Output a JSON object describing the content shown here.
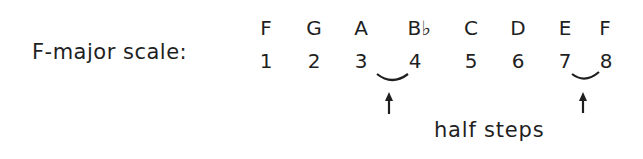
{
  "label": "F-major scale:",
  "notes": [
    "F",
    "G",
    "A",
    "B♭",
    "C",
    "D",
    "E",
    "F"
  ],
  "degrees": [
    "1",
    "2",
    "3",
    "4",
    "5",
    "6",
    "7",
    "8"
  ],
  "half_step_pairs": [
    [
      "3",
      "4"
    ],
    [
      "7",
      "8"
    ]
  ],
  "caption": "half steps",
  "icons": {
    "slur": "slur-arc",
    "arrow": "up-arrow"
  }
}
